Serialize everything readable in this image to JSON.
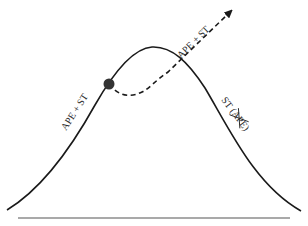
{
  "diagram": {
    "type": "bell-curve-trajectory",
    "colors": {
      "curve": "#1a1a1a",
      "dashed_path": "#1a1a1a",
      "point": "#333333",
      "baseline": "#555555",
      "background": "#ffffff"
    },
    "labels": {
      "left_slope": "APE + ST",
      "dashed_arrow": "APE + ST",
      "right_slope_prefix": "ST (",
      "right_slope_struck": "APE",
      "right_slope_suffix": ")"
    },
    "caption": "Figure 7.3 Lengthened life span with continued"
  }
}
